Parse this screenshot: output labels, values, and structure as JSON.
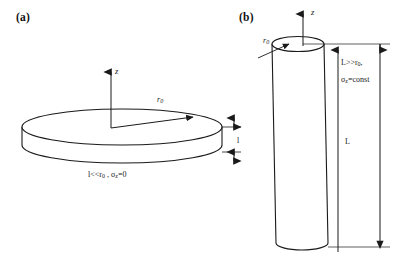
{
  "figure": {
    "width": 407,
    "height": 266,
    "background": "#ffffff",
    "stroke_color": "#1a1a1a"
  },
  "panels": [
    {
      "id": "a",
      "label": "(a)",
      "shape": "thin-disk",
      "axis_label": "z",
      "radius_label": "r",
      "radius_sub": "0",
      "thickness_label": "l",
      "condition_text": "l<<r0 , σz =0",
      "condition_parts": {
        "thickness": "l",
        "relation": "<<",
        "radius": "r",
        "radius_sub": "0",
        "separator": " , ",
        "stress_symbol": "σ",
        "stress_sub": "z",
        "stress_value": "=0"
      }
    },
    {
      "id": "b",
      "label": "(b)",
      "shape": "long-cylinder",
      "axis_label": "z",
      "radius_label": "r",
      "radius_sub": "0",
      "length_label": "L",
      "condition_line_1": "L>>r0,",
      "condition_line_2": "σz=const",
      "condition_parts": {
        "length": "L",
        "relation": "&gt;&gt;",
        "radius": "r",
        "radius_sub": "0",
        "trailing_comma": ",",
        "stress_symbol": "σ",
        "stress_sub": "z",
        "stress_value": "=const"
      }
    }
  ]
}
